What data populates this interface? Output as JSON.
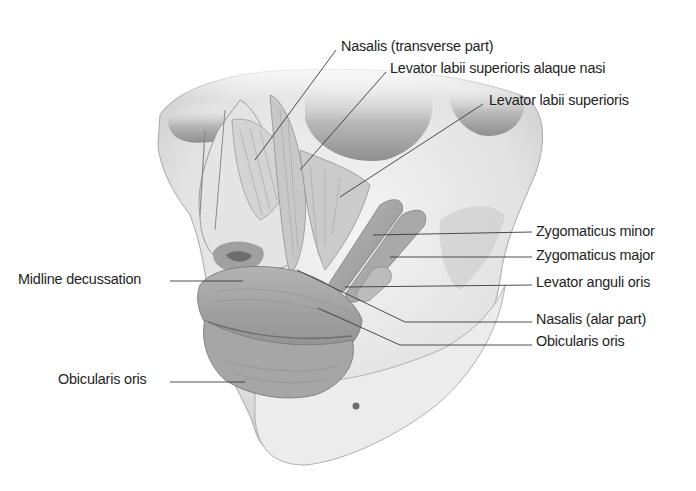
{
  "figure": {
    "colors": {
      "background": "#ffffff",
      "label_text": "#1e1e1e",
      "leader_line": "#3a3a3a",
      "bone": "#e9e9e9",
      "bone_shadow": "#b8b8b8",
      "muscle": "#9a9a9a",
      "muscle_light": "#c4c4c4"
    }
  },
  "labels": [
    {
      "id": "nasalis-transverse",
      "text": "Nasalis (transverse part)",
      "x": 341,
      "y": 37,
      "line": [
        [
          336,
          50
        ],
        [
          255,
          160
        ]
      ]
    },
    {
      "id": "levator-labii-sup-alaque-nasi",
      "text": "Levator labii superioris alaque nasi",
      "x": 390,
      "y": 59,
      "line": [
        [
          386,
          72
        ],
        [
          300,
          170
        ]
      ]
    },
    {
      "id": "levator-labii-sup",
      "text": "Levator labii superioris",
      "x": 489,
      "y": 91,
      "line": [
        [
          483,
          104
        ],
        [
          340,
          197
        ]
      ]
    },
    {
      "id": "zygomaticus-minor",
      "text": "Zygomaticus minor",
      "x": 536,
      "y": 222,
      "line": [
        [
          532,
          232
        ],
        [
          373,
          235
        ]
      ]
    },
    {
      "id": "zygomaticus-major",
      "text": "Zygomaticus major",
      "x": 536,
      "y": 246,
      "line": [
        [
          532,
          257
        ],
        [
          390,
          257
        ]
      ]
    },
    {
      "id": "levator-anguli-oris",
      "text": "Levator anguli oris",
      "x": 536,
      "y": 273,
      "line": [
        [
          532,
          285
        ],
        [
          345,
          287
        ]
      ]
    },
    {
      "id": "nasalis-alar",
      "text": "Nasalis (alar part)",
      "x": 536,
      "y": 310,
      "line": [
        [
          532,
          322
        ],
        [
          405,
          322
        ],
        [
          297,
          270
        ]
      ]
    },
    {
      "id": "obicularis-oris-right",
      "text": "Obicularis oris",
      "x": 536,
      "y": 332,
      "line": [
        [
          532,
          345
        ],
        [
          400,
          345
        ],
        [
          318,
          308
        ]
      ]
    },
    {
      "id": "midline-decussation",
      "text": "Midline decussation",
      "x": 18,
      "y": 270,
      "line": [
        [
          170,
          281
        ],
        [
          243,
          281
        ]
      ]
    },
    {
      "id": "obicularis-oris-left",
      "text": "Obicularis oris",
      "x": 58,
      "y": 370,
      "line": [
        [
          170,
          382
        ],
        [
          245,
          382
        ]
      ]
    }
  ]
}
